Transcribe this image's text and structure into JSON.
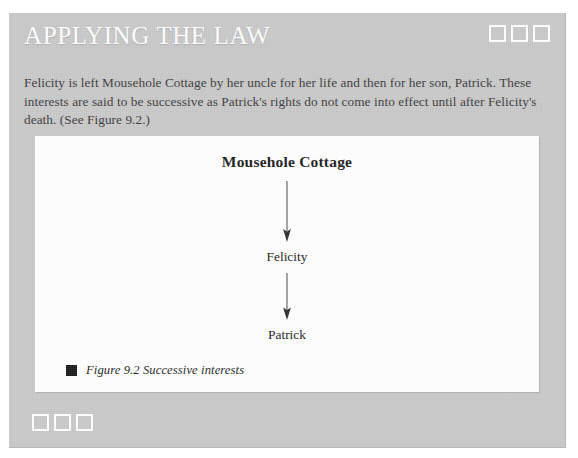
{
  "panel": {
    "title": "APPLYING THE LAW",
    "background_color": "#c8c8c8",
    "title_color": "#ffffff"
  },
  "decorations": {
    "top_right_squares": [
      "square-1",
      "square-2",
      "square-3"
    ],
    "bottom_left_squares": [
      "square-1",
      "square-2",
      "square-3"
    ],
    "square_color": "#ffffff"
  },
  "intro": {
    "paragraph": "Felicity is left Mousehole Cottage by her uncle for her life and then for her son, Patrick. These interests are said to be successive as Patrick's rights do not come into effect until after Felicity's death. (See Figure 9.2.)"
  },
  "figure": {
    "background_color": "#ffffff",
    "diagram": {
      "type": "flow-chart",
      "orientation": "vertical",
      "nodes": [
        {
          "id": "root",
          "label": "Mousehole Cottage",
          "emphasis": "bold"
        },
        {
          "id": "mid",
          "label": "Felicity",
          "emphasis": "normal"
        },
        {
          "id": "leaf",
          "label": "Patrick",
          "emphasis": "normal"
        }
      ],
      "edges": [
        {
          "from": "root",
          "to": "mid",
          "arrow": "down-arrow"
        },
        {
          "from": "mid",
          "to": "leaf",
          "arrow": "down-arrow"
        }
      ]
    },
    "caption": {
      "bullet_color": "#1a1a1a",
      "text": "Figure 9.2 Successive interests"
    }
  }
}
